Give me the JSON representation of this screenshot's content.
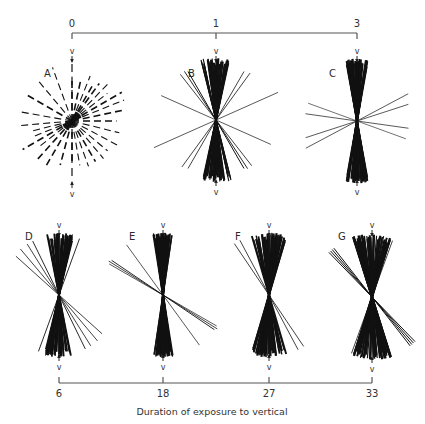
{
  "figure": {
    "caption": "Duration of exposure to vertical",
    "top_axis": {
      "ticks": [
        {
          "label": "0",
          "x": 72
        },
        {
          "label": "1",
          "x": 216
        },
        {
          "label": "3",
          "x": 357
        }
      ],
      "y": 33
    },
    "bottom_axis": {
      "ticks": [
        {
          "label": "6",
          "x": 59
        },
        {
          "label": "18",
          "x": 163
        },
        {
          "label": "27",
          "x": 269
        },
        {
          "label": "33",
          "x": 372
        }
      ],
      "y": 383
    },
    "vertical_marker": "v",
    "panels": [
      {
        "id": "A",
        "cx": 72,
        "cy": 121,
        "top_y": 62,
        "bottom_y": 182,
        "style": "dashed"
      },
      {
        "id": "B",
        "cx": 216,
        "cy": 120,
        "top_y": 62,
        "bottom_y": 180,
        "style": "solid"
      },
      {
        "id": "C",
        "cx": 357,
        "cy": 121,
        "top_y": 62,
        "bottom_y": 180,
        "style": "solid"
      },
      {
        "id": "D",
        "cx": 59,
        "cy": 295,
        "top_y": 236,
        "bottom_y": 355,
        "style": "solid"
      },
      {
        "id": "E",
        "cx": 163,
        "cy": 295,
        "top_y": 236,
        "bottom_y": 355,
        "style": "solid"
      },
      {
        "id": "F",
        "cx": 269,
        "cy": 295,
        "top_y": 236,
        "bottom_y": 355,
        "style": "solid"
      },
      {
        "id": "G",
        "cx": 372,
        "cy": 297,
        "top_y": 236,
        "bottom_y": 357,
        "style": "solid"
      }
    ]
  }
}
